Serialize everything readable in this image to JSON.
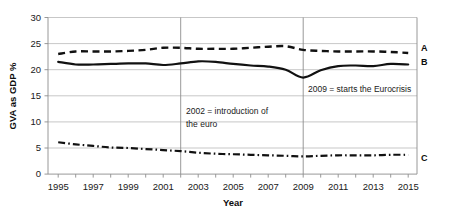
{
  "chart_data": {
    "type": "line",
    "title": "",
    "xlabel": "Year",
    "ylabel": "GVA as GDP %",
    "xlim": [
      1995,
      2015
    ],
    "ylim": [
      0,
      30
    ],
    "grid": true,
    "legend_position": "right-edge-inline",
    "x": [
      1995,
      1996,
      1997,
      1998,
      1999,
      2000,
      2001,
      2002,
      2003,
      2004,
      2005,
      2006,
      2007,
      2008,
      2009,
      2010,
      2011,
      2012,
      2013,
      2014,
      2015
    ],
    "y_ticks": [
      0,
      5,
      10,
      15,
      20,
      25,
      30
    ],
    "x_ticks": [
      1995,
      1997,
      1999,
      2001,
      2003,
      2005,
      2007,
      2009,
      2011,
      2013,
      2015
    ],
    "x_minor_ticks": [
      1996,
      1998,
      2000,
      2002,
      2004,
      2006,
      2008,
      2010,
      2012,
      2014
    ],
    "series": [
      {
        "name": "A",
        "label": "A",
        "style": "dashed",
        "color": "#111111",
        "values": [
          23.0,
          23.5,
          23.5,
          23.5,
          23.6,
          23.8,
          24.2,
          24.2,
          24.0,
          24.0,
          24.0,
          24.2,
          24.4,
          24.5,
          23.8,
          23.6,
          23.5,
          23.5,
          23.5,
          23.4,
          23.2
        ]
      },
      {
        "name": "B",
        "label": "B",
        "style": "solid",
        "color": "#111111",
        "values": [
          21.5,
          21.0,
          21.0,
          21.1,
          21.2,
          21.2,
          20.9,
          21.2,
          21.6,
          21.5,
          21.1,
          20.8,
          20.6,
          20.0,
          18.5,
          19.9,
          20.7,
          20.8,
          20.7,
          21.1,
          21.0
        ]
      },
      {
        "name": "C",
        "label": "C",
        "style": "dash-dot",
        "color": "#111111",
        "values": [
          6.1,
          5.7,
          5.4,
          5.1,
          5.0,
          4.8,
          4.6,
          4.4,
          4.1,
          3.9,
          3.8,
          3.7,
          3.6,
          3.5,
          3.4,
          3.5,
          3.6,
          3.6,
          3.6,
          3.7,
          3.7
        ]
      }
    ],
    "annotations": [
      {
        "name": "euro-introduction",
        "at_x": 2002,
        "line1": "2002 = introduction of",
        "line2": "the euro"
      },
      {
        "name": "eurocrisis-start",
        "at_x": 2009,
        "line1": "2009 = starts the Eurocrisis",
        "line2": ""
      }
    ],
    "reference_lines": [
      2002,
      2009
    ]
  },
  "axes": {
    "y_title": "GVA as GDP %",
    "x_title": "Year",
    "y_tick_labels": [
      "0",
      "5",
      "10",
      "15",
      "20",
      "25",
      "30"
    ],
    "x_tick_labels": [
      "1995",
      "1997",
      "1999",
      "2001",
      "2003",
      "2005",
      "2007",
      "2009",
      "2011",
      "2013",
      "2015"
    ]
  },
  "labels": {
    "series_a": "A",
    "series_b": "B",
    "series_c": "C",
    "annotation_euro_line1": "2002 = introduction of",
    "annotation_euro_line2": "the euro",
    "annotation_crisis_line1": "2009 = starts the Eurocrisis"
  },
  "colors": {
    "line": "#111111",
    "grid": "#b8b8b8",
    "axis": "#7a7a7a",
    "reference": "#8a8a8a",
    "background": "#ffffff"
  }
}
